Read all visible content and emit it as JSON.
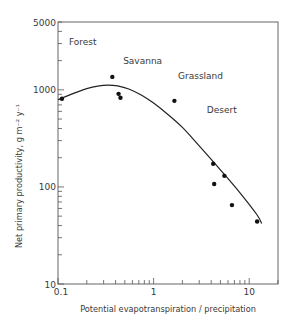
{
  "chart_data": {
    "type": "scatter",
    "title": "",
    "xlabel": "Potential evapotranspiration / precipitation",
    "ylabel": "Net primary productivity, g m⁻² y⁻¹",
    "xscale": "log",
    "yscale": "log",
    "xlim": [
      0.1,
      20
    ],
    "ylim": [
      10,
      5000
    ],
    "grid": false,
    "legend": null,
    "x_ticks": [
      {
        "value": 0.1,
        "label": "0.1"
      },
      {
        "value": 1,
        "label": "1"
      },
      {
        "value": 10,
        "label": "10"
      }
    ],
    "y_ticks": [
      {
        "value": 10,
        "label": "10"
      },
      {
        "value": 100,
        "label": "100"
      },
      {
        "value": 1000,
        "label": "1000"
      },
      {
        "value": 5000,
        "label": "5000"
      }
    ],
    "series": [
      {
        "name": "observations",
        "type": "scatter",
        "points": [
          {
            "x": 0.11,
            "y": 810
          },
          {
            "x": 0.37,
            "y": 1360
          },
          {
            "x": 0.43,
            "y": 910
          },
          {
            "x": 0.45,
            "y": 830
          },
          {
            "x": 1.65,
            "y": 770
          },
          {
            "x": 4.2,
            "y": 173
          },
          {
            "x": 5.5,
            "y": 130
          },
          {
            "x": 4.3,
            "y": 107
          },
          {
            "x": 6.6,
            "y": 65
          },
          {
            "x": 12.1,
            "y": 44
          }
        ]
      },
      {
        "name": "fitted curve",
        "type": "line",
        "points": [
          {
            "x": 0.1,
            "y": 790
          },
          {
            "x": 0.15,
            "y": 930
          },
          {
            "x": 0.2,
            "y": 1030
          },
          {
            "x": 0.27,
            "y": 1100
          },
          {
            "x": 0.33,
            "y": 1120
          },
          {
            "x": 0.42,
            "y": 1100
          },
          {
            "x": 0.55,
            "y": 1020
          },
          {
            "x": 0.75,
            "y": 880
          },
          {
            "x": 1.0,
            "y": 730
          },
          {
            "x": 1.4,
            "y": 560
          },
          {
            "x": 2.0,
            "y": 410
          },
          {
            "x": 3.0,
            "y": 265
          },
          {
            "x": 5.0,
            "y": 150
          },
          {
            "x": 8.0,
            "y": 87
          },
          {
            "x": 12.0,
            "y": 52
          },
          {
            "x": 13.5,
            "y": 42
          }
        ]
      }
    ],
    "annotations": [
      {
        "text": "Forest",
        "x": 0.13,
        "y": 2900
      },
      {
        "text": "Savanna",
        "x": 0.48,
        "y": 1850
      },
      {
        "text": "Grassland",
        "x": 1.8,
        "y": 1300
      },
      {
        "text": "Desert",
        "x": 3.6,
        "y": 580
      }
    ]
  }
}
